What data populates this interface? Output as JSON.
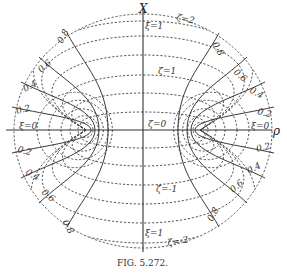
{
  "figure": {
    "caption": "FIG. 5.272.",
    "axes": {
      "vertical": "X",
      "horizontal": "ρ"
    },
    "zeta_labels": {
      "top": "ζ=2",
      "upper": "ζ=1",
      "center": "ζ=0",
      "lower": "ζ=-1",
      "bottom": "ζ=-2"
    },
    "xi_labels": {
      "axis_top": "ξ=1",
      "axis_bottom": "ξ=1",
      "left_axis": "ξ=0",
      "right_axis": "ξ=0"
    },
    "hyperbola_values": [
      "0.2",
      "0.4",
      "0.6",
      "0.8"
    ],
    "foci": [
      {
        "x": 86,
        "y": 130
      },
      {
        "x": 200,
        "y": 130
      }
    ],
    "center": {
      "x": 143,
      "y": 130
    },
    "zeta_axis_crossings_upper": [
      21,
      36,
      55,
      75,
      93,
      112
    ],
    "zeta_axis_crossings_lower": [
      148,
      166,
      185,
      204,
      223,
      243
    ],
    "colors": {
      "ink": "#333333",
      "background": "#ffffff"
    }
  }
}
